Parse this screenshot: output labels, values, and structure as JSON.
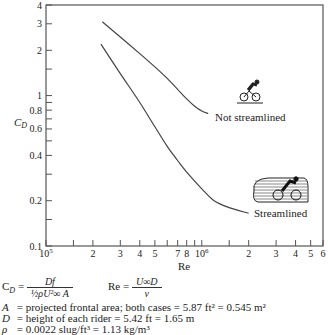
{
  "chart_data": {
    "type": "line",
    "xscale": "log",
    "yscale": "log",
    "xlabel": "Re",
    "ylabel": "C_D",
    "xlim": [
      100000,
      6000000
    ],
    "ylim": [
      0.1,
      4
    ],
    "grid": false,
    "x_ticks": [
      {
        "value": 100000,
        "label": "10^5"
      },
      {
        "value": 150000,
        "label": ""
      },
      {
        "value": 200000,
        "label": "2"
      },
      {
        "value": 300000,
        "label": "3"
      },
      {
        "value": 400000,
        "label": "4"
      },
      {
        "value": 500000,
        "label": "5"
      },
      {
        "value": 600000,
        "label": ""
      },
      {
        "value": 700000,
        "label": "7"
      },
      {
        "value": 800000,
        "label": "8"
      },
      {
        "value": 900000,
        "label": ""
      },
      {
        "value": 1000000,
        "label": "10^6"
      },
      {
        "value": 1500000,
        "label": ""
      },
      {
        "value": 2000000,
        "label": "2"
      },
      {
        "value": 3000000,
        "label": "3"
      },
      {
        "value": 4000000,
        "label": "4"
      },
      {
        "value": 5000000,
        "label": "5"
      },
      {
        "value": 6000000,
        "label": "6"
      }
    ],
    "y_ticks": [
      {
        "value": 0.1,
        "label": "0.1"
      },
      {
        "value": 0.15,
        "label": ""
      },
      {
        "value": 0.2,
        "label": "0.2"
      },
      {
        "value": 0.3,
        "label": ""
      },
      {
        "value": 0.4,
        "label": "0.4"
      },
      {
        "value": 0.5,
        "label": ""
      },
      {
        "value": 0.6,
        "label": "0.6"
      },
      {
        "value": 0.7,
        "label": ""
      },
      {
        "value": 0.8,
        "label": "0.8"
      },
      {
        "value": 0.9,
        "label": ""
      },
      {
        "value": 1,
        "label": "1"
      },
      {
        "value": 1.5,
        "label": ""
      },
      {
        "value": 2,
        "label": "2"
      },
      {
        "value": 3,
        "label": "3"
      },
      {
        "value": 4,
        "label": "4"
      }
    ],
    "series": [
      {
        "name": "Not streamlined",
        "x": [
          230000,
          300000,
          400000,
          500000,
          600000,
          700000,
          800000,
          900000,
          1000000,
          1100000
        ],
        "y": [
          3.1,
          2.45,
          1.9,
          1.55,
          1.3,
          1.1,
          0.95,
          0.85,
          0.79,
          0.76
        ]
      },
      {
        "name": "Streamlined",
        "x": [
          225000,
          300000,
          400000,
          500000,
          600000,
          700000,
          800000,
          1000000,
          1200000,
          1500000,
          2000000
        ],
        "y": [
          2.2,
          1.4,
          0.9,
          0.62,
          0.46,
          0.37,
          0.31,
          0.24,
          0.2,
          0.18,
          0.165
        ]
      }
    ],
    "annotations": [
      "Not streamlined",
      "Streamlined"
    ]
  },
  "labels": {
    "ylabel_main": "C",
    "ylabel_sub": "D",
    "xlabel": "Re",
    "not_streamlined": "Not streamlined",
    "streamlined": "Streamlined"
  },
  "formulas": {
    "cd_lhs": "C",
    "cd_lhs_sub": "D",
    "cd_eq": "=",
    "cd_num": "Df",
    "cd_den": "½ρU²∞ A",
    "re_lhs": "Re =",
    "re_num": "U∞D",
    "re_den": "ν"
  },
  "notes": [
    {
      "symbol": "A",
      "text": "= projected frontal area; both cases = 5.87 ft² = 0.545 m²"
    },
    {
      "symbol": "D",
      "text": "= height of each rider = 5.42 ft = 1.65 m"
    },
    {
      "symbol": "ρ",
      "text": "= 0.0022 slug/ft³ = 1.13 kg/m³"
    }
  ],
  "colors": {
    "curve": "#444444",
    "axis": "#555555",
    "text": "#222222"
  }
}
